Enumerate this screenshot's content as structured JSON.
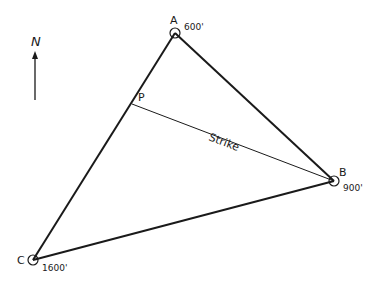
{
  "diagram": {
    "north_label": "N",
    "points": {
      "A": {
        "label": "A",
        "elevation": "600'"
      },
      "B": {
        "label": "B",
        "elevation": "900'"
      },
      "C": {
        "label": "C",
        "elevation": "1600'"
      },
      "P": {
        "label": "P"
      }
    },
    "strike_label": "Strike",
    "colors": {
      "line": "#1a1a1a",
      "background": "#ffffff"
    }
  }
}
